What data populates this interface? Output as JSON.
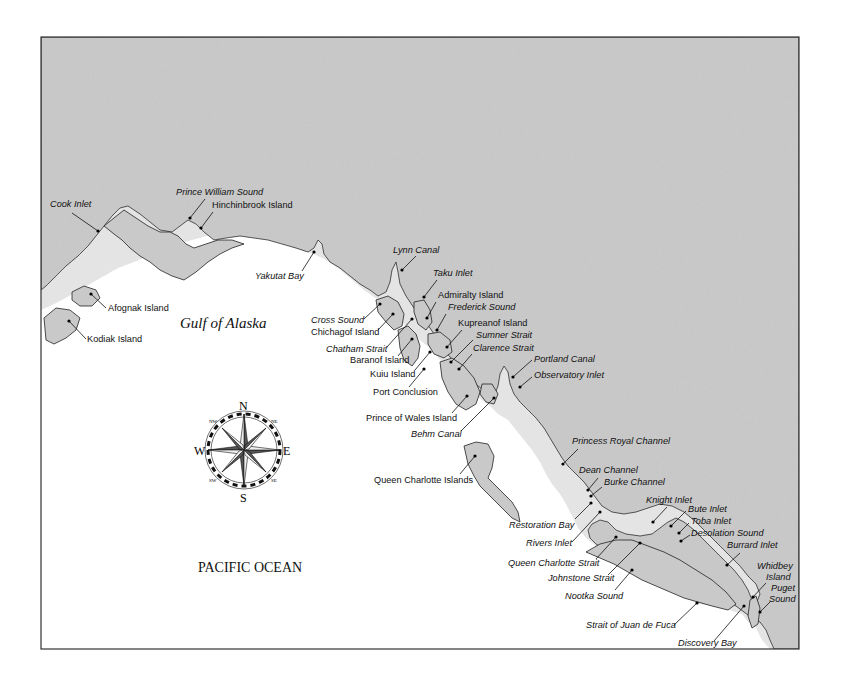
{
  "map": {
    "frame": {
      "x": 41,
      "y": 37,
      "width": 758,
      "height": 612
    },
    "colors": {
      "land": "#c9c9c9",
      "water": "#ffffff",
      "coast": "#222222",
      "halo": "#e4e4e4",
      "border": "#333333"
    },
    "water_bodies": {
      "gulf": "Gulf of Alaska",
      "ocean": "PACIFIC OCEAN"
    },
    "compass": {
      "north": "N",
      "south": "S",
      "east": "E",
      "west": "W",
      "northeast": "NE",
      "northwest": "NW",
      "southeast": "SE",
      "southwest": "SW"
    },
    "labels": [
      {
        "id": "cook-inlet",
        "text": "Cook Inlet",
        "italic": true,
        "x": 50,
        "y": 207,
        "anchor": "start",
        "dot": [
          98,
          231
        ],
        "line": [
          72,
          213,
          98,
          231
        ]
      },
      {
        "id": "prince-william-sound",
        "text": "Prince William Sound",
        "italic": true,
        "x": 176,
        "y": 195,
        "anchor": "start",
        "dot": [
          190,
          218
        ],
        "line": [
          205,
          199,
          190,
          218
        ]
      },
      {
        "id": "hinchinbrook-island",
        "text": "Hinchinbrook Island",
        "italic": false,
        "x": 212,
        "y": 208,
        "anchor": "start",
        "dot": [
          201,
          228
        ],
        "line": [
          213,
          212,
          201,
          228
        ]
      },
      {
        "id": "yakutat-bay",
        "text": "Yakutat Bay",
        "italic": true,
        "x": 255,
        "y": 279,
        "anchor": "start",
        "dot": [
          314,
          252
        ],
        "line": [
          302,
          271,
          314,
          252
        ]
      },
      {
        "id": "afognak-island",
        "text": "Afognak Island",
        "italic": false,
        "x": 108,
        "y": 311,
        "anchor": "start",
        "dot": [
          91,
          294
        ],
        "line": [
          106,
          308,
          91,
          294
        ]
      },
      {
        "id": "kodiak-island",
        "text": "Kodiak Island",
        "italic": false,
        "x": 87,
        "y": 342,
        "anchor": "start",
        "dot": [
          69,
          321
        ],
        "line": [
          86,
          339,
          69,
          321
        ]
      },
      {
        "id": "lynn-canal",
        "text": "Lynn Canal",
        "italic": true,
        "x": 393,
        "y": 253,
        "anchor": "start",
        "dot": [
          402,
          270
        ],
        "line": [
          416,
          256,
          402,
          270
        ]
      },
      {
        "id": "taku-inlet",
        "text": "Taku Inlet",
        "italic": true,
        "x": 433,
        "y": 276,
        "anchor": "start",
        "dot": [
          424,
          297
        ],
        "line": [
          437,
          280,
          424,
          297
        ]
      },
      {
        "id": "admiralty-island",
        "text": "Admiralty Island",
        "italic": false,
        "x": 438,
        "y": 298,
        "anchor": "start",
        "dot": [
          427,
          318
        ],
        "line": [
          436,
          302,
          427,
          318
        ]
      },
      {
        "id": "frederick-sound",
        "text": "Frederick Sound",
        "italic": true,
        "x": 448,
        "y": 310,
        "anchor": "start",
        "dot": [
          437,
          330
        ],
        "line": [
          446,
          314,
          437,
          330
        ]
      },
      {
        "id": "kupreanof-island",
        "text": "Kupreanof Island",
        "italic": false,
        "x": 458,
        "y": 326,
        "anchor": "start",
        "dot": [
          447,
          347
        ],
        "line": [
          462,
          330,
          447,
          347
        ]
      },
      {
        "id": "sumner-strait",
        "text": "Sumner Strait",
        "italic": true,
        "x": 476,
        "y": 338,
        "anchor": "start",
        "dot": [
          451,
          362
        ],
        "line": [
          473,
          340,
          451,
          362
        ]
      },
      {
        "id": "clarence-strait",
        "text": "Clarence Strait",
        "italic": true,
        "x": 473,
        "y": 351,
        "anchor": "start",
        "dot": [
          459,
          369
        ],
        "line": [
          472,
          354,
          459,
          369
        ]
      },
      {
        "id": "cross-sound",
        "text": "Cross Sound",
        "italic": true,
        "x": 311,
        "y": 323,
        "anchor": "start",
        "dot": [
          380,
          304
        ],
        "line": [
          364,
          319,
          380,
          304
        ]
      },
      {
        "id": "chichagof-island",
        "text": "Chichagof Island",
        "italic": false,
        "x": 311,
        "y": 335,
        "anchor": "start",
        "dot": [
          393,
          314
        ],
        "line": [
          378,
          330,
          393,
          314
        ]
      },
      {
        "id": "chatham-strait",
        "text": "Chatham Strait",
        "italic": true,
        "x": 326,
        "y": 352,
        "anchor": "start",
        "dot": [
          412,
          319
        ],
        "line": [
          387,
          347,
          412,
          319
        ]
      },
      {
        "id": "baranof-island",
        "text": "Baranof Island",
        "italic": false,
        "x": 350,
        "y": 363,
        "anchor": "start",
        "dot": [
          412,
          339
        ],
        "line": [
          398,
          356,
          412,
          339
        ]
      },
      {
        "id": "kuiu-island",
        "text": "Kuiu Island",
        "italic": false,
        "x": 370,
        "y": 377,
        "anchor": "start",
        "dot": [
          430,
          352
        ],
        "line": [
          415,
          370,
          430,
          352
        ]
      },
      {
        "id": "port-conclusion",
        "text": "Port Conclusion",
        "italic": false,
        "x": 373,
        "y": 395,
        "anchor": "start",
        "dot": [
          424,
          369
        ],
        "line": [
          409,
          387,
          424,
          369
        ]
      },
      {
        "id": "portland-canal",
        "text": "Portland Canal",
        "italic": true,
        "x": 534,
        "y": 362,
        "anchor": "start",
        "dot": [
          513,
          377
        ],
        "line": [
          532,
          360,
          513,
          377
        ]
      },
      {
        "id": "observatory-inlet",
        "text": "Observatory Inlet",
        "italic": true,
        "x": 534,
        "y": 378,
        "anchor": "start",
        "dot": [
          520,
          387
        ],
        "line": [
          532,
          377,
          520,
          387
        ]
      },
      {
        "id": "prince-of-wales-island",
        "text": "Prince of Wales Island",
        "italic": false,
        "x": 366,
        "y": 421,
        "anchor": "start",
        "dot": [
          467,
          396
        ],
        "line": [
          452,
          413,
          467,
          396
        ]
      },
      {
        "id": "behm-canal",
        "text": "Behm Canal",
        "italic": true,
        "x": 411,
        "y": 437,
        "anchor": "start",
        "dot": [
          494,
          398
        ],
        "line": [
          461,
          431,
          494,
          398
        ]
      },
      {
        "id": "queen-charlotte-islands",
        "text": "Queen Charlotte Islands",
        "italic": false,
        "x": 374,
        "y": 483,
        "anchor": "start",
        "dot": [
          475,
          456
        ],
        "line": [
          460,
          474,
          475,
          456
        ]
      },
      {
        "id": "princess-royal-channel",
        "text": "Princess Royal Channel",
        "italic": true,
        "x": 572,
        "y": 444,
        "anchor": "start",
        "dot": [
          563,
          464
        ],
        "line": [
          578,
          449,
          563,
          464
        ]
      },
      {
        "id": "dean-channel",
        "text": "Dean Channel",
        "italic": true,
        "x": 579,
        "y": 473,
        "anchor": "start",
        "dot": [
          588,
          490
        ],
        "line": [
          598,
          478,
          588,
          490
        ]
      },
      {
        "id": "burke-channel",
        "text": "Burke Channel",
        "italic": true,
        "x": 604,
        "y": 485,
        "anchor": "start",
        "dot": [
          591,
          496
        ],
        "line": [
          602,
          487,
          591,
          496
        ]
      },
      {
        "id": "restoration-bay",
        "text": "Restoration Bay",
        "italic": true,
        "x": 509,
        "y": 528,
        "anchor": "start",
        "dot": [
          591,
          503
        ],
        "line": [
          575,
          519,
          591,
          503
        ]
      },
      {
        "id": "rivers-inlet",
        "text": "Rivers Inlet",
        "italic": true,
        "x": 526,
        "y": 546,
        "anchor": "start",
        "dot": [
          600,
          512
        ],
        "line": [
          572,
          542,
          600,
          512
        ]
      },
      {
        "id": "knight-inlet",
        "text": "Knight Inlet",
        "italic": true,
        "x": 646,
        "y": 503,
        "anchor": "start",
        "dot": [
          653,
          522
        ],
        "line": [
          667,
          507,
          653,
          522
        ]
      },
      {
        "id": "bute-inlet",
        "text": "Bute Inlet",
        "italic": true,
        "x": 688,
        "y": 512,
        "anchor": "start",
        "dot": [
          671,
          526
        ],
        "line": [
          686,
          511,
          671,
          526
        ]
      },
      {
        "id": "toba-inlet",
        "text": "Toba Inlet",
        "italic": true,
        "x": 691,
        "y": 524,
        "anchor": "start",
        "dot": [
          679,
          533
        ],
        "line": [
          689,
          523,
          679,
          533
        ]
      },
      {
        "id": "desolation-sound",
        "text": "Desolation Sound",
        "italic": true,
        "x": 691,
        "y": 536,
        "anchor": "start",
        "dot": [
          681,
          541
        ],
        "line": [
          690,
          535,
          681,
          541
        ]
      },
      {
        "id": "queen-charlotte-strait",
        "text": "Queen Charlotte Strait",
        "italic": true,
        "x": 508,
        "y": 566,
        "anchor": "start",
        "dot": [
          616,
          537
        ],
        "line": [
          596,
          559,
          616,
          537
        ]
      },
      {
        "id": "burrard-inlet",
        "text": "Burrard Inlet",
        "italic": true,
        "x": 727,
        "y": 548,
        "anchor": "start",
        "dot": [
          727,
          565
        ],
        "line": [
          740,
          553,
          727,
          565
        ]
      },
      {
        "id": "johnstone-strait",
        "text": "Johnstone Strait",
        "italic": true,
        "x": 548,
        "y": 581,
        "anchor": "start",
        "dot": [
          640,
          543
        ],
        "line": [
          608,
          575,
          640,
          543
        ]
      },
      {
        "id": "whidbey-island",
        "text": "Whidbey",
        "text2": "Island",
        "italic": true,
        "x": 757,
        "y": 569,
        "x2": 766,
        "y2": 580,
        "anchor": "start",
        "dot": [
          753,
          597
        ],
        "line": [
          766,
          583,
          753,
          597
        ]
      },
      {
        "id": "puget-sound",
        "text": "Puget",
        "text2": "Sound",
        "italic": true,
        "x": 771,
        "y": 591,
        "x2": 769,
        "y2": 602,
        "anchor": "start",
        "dot": [
          760,
          612
        ],
        "line": [
          770,
          602,
          760,
          612
        ]
      },
      {
        "id": "nootka-sound",
        "text": "Nootka Sound",
        "italic": true,
        "x": 565,
        "y": 599,
        "anchor": "start",
        "dot": [
          632,
          570
        ],
        "line": [
          615,
          590,
          632,
          570
        ]
      },
      {
        "id": "strait-of-juan-de-fuca",
        "text": "Strait of Juan de Fuca",
        "italic": true,
        "x": 586,
        "y": 628,
        "anchor": "start",
        "dot": [
          697,
          603
        ],
        "line": [
          674,
          625,
          697,
          603
        ]
      },
      {
        "id": "discovery-bay",
        "text": "Discovery Bay",
        "italic": true,
        "x": 678,
        "y": 646,
        "anchor": "start",
        "dot": [
          744,
          606
        ],
        "line": [
          714,
          641,
          744,
          606
        ]
      }
    ]
  }
}
